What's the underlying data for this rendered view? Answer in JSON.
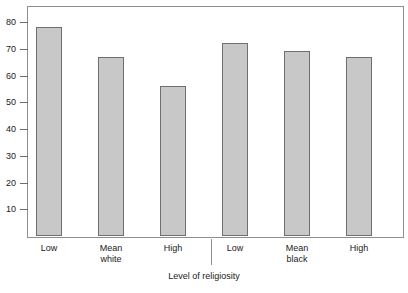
{
  "figure": {
    "clipped_top_text": "",
    "background_color": "#ffffff",
    "frame_color": "#8f8f8f",
    "bar_fill_color": "#c8c8c8",
    "bar_edge_color": "#6f6f6f"
  },
  "chart_data": {
    "type": "bar",
    "title": "",
    "xlabel": "Level of religiosity",
    "ylabel": "",
    "ylim": [
      0,
      86
    ],
    "yticks": [
      10,
      20,
      30,
      40,
      50,
      60,
      70,
      80
    ],
    "grid": false,
    "legend": null,
    "categories": [
      "Low",
      "Mean",
      "High",
      "Low",
      "Mean",
      "High"
    ],
    "group_labels": [
      "white",
      "black"
    ],
    "groups": [
      {
        "name": "white",
        "categories": [
          "Low",
          "Mean",
          "High"
        ],
        "values": [
          78,
          67,
          56
        ]
      },
      {
        "name": "black",
        "categories": [
          "Low",
          "Mean",
          "High"
        ],
        "values": [
          72,
          69,
          67
        ]
      }
    ],
    "values": [
      78,
      67,
      56,
      72,
      69,
      67
    ],
    "bars": [
      {
        "label": "Low",
        "group": "white",
        "value": 78
      },
      {
        "label": "Mean",
        "group": "white",
        "value": 67
      },
      {
        "label": "High",
        "group": "white",
        "value": 56
      },
      {
        "label": "Low",
        "group": "black",
        "value": 72
      },
      {
        "label": "Mean",
        "group": "black",
        "value": 69
      },
      {
        "label": "High",
        "group": "black",
        "value": 67
      }
    ]
  }
}
